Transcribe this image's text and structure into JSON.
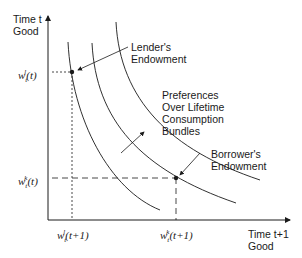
{
  "y_axis": {
    "line1": "Time t",
    "line2": "Good"
  },
  "x_axis": {
    "line1": "Time t+1",
    "line2": "Good"
  },
  "annotations": {
    "lender": {
      "line1": "Lender's",
      "line2": "Endowment"
    },
    "borrower": {
      "line1": "Borrower's",
      "line2": "Endowment"
    },
    "preferences": {
      "line1": "Preferences",
      "line2": "Over Lifetime",
      "line3": "Consumption",
      "line4": "Bundles"
    }
  },
  "ticks": {
    "y_lender": "w_t^l(t)",
    "y_borrower": "w_t^k(t)",
    "x_lender": "w_t^l(t+1)",
    "x_borrower": "w_t^k(t+1)"
  },
  "points": {
    "lender": {
      "x": 72,
      "y": 72
    },
    "borrower": {
      "x": 176,
      "y": 178
    }
  }
}
